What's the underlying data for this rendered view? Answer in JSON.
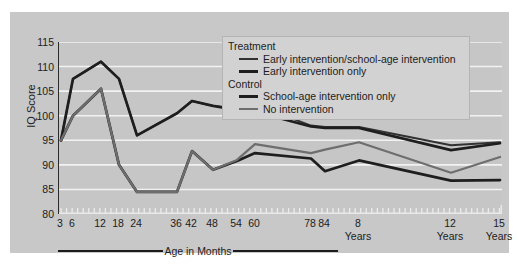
{
  "chart_data": {
    "type": "line",
    "title": "",
    "xlabel": "Age in Months",
    "ylabel": "IQ Score",
    "ylim": [
      80,
      115
    ],
    "yticks": [
      115,
      110,
      105,
      100,
      95,
      90,
      85,
      80
    ],
    "grid": true,
    "legend_position": "top-right",
    "x_axis_sections": [
      {
        "label": "Age in Months",
        "ticks": [
          "3",
          "6",
          "12",
          "18",
          "24",
          "36",
          "42",
          "48",
          "54",
          "60",
          "78",
          "84"
        ]
      },
      {
        "label": "Years",
        "ticks": [
          "8",
          "12",
          "15"
        ]
      }
    ],
    "x": [
      3,
      6,
      12,
      18,
      24,
      36,
      42,
      48,
      54,
      60,
      78,
      84,
      96,
      144,
      180
    ],
    "x_tick_labels": [
      "3",
      "6",
      "12",
      "18",
      "24",
      "36",
      "42",
      "48",
      "54",
      "60",
      "78",
      "84",
      "8",
      "12",
      "15"
    ],
    "x_tick_sublabels": [
      "",
      "",
      "",
      "",
      "",
      "",
      "",
      "",
      "",
      "",
      "",
      "",
      "Years",
      "Years",
      "Years"
    ],
    "series": [
      {
        "name": "Early intervention/school-age intervention",
        "group": "Treatment",
        "color": "#323232",
        "values": [
          95.0,
          107.5,
          111.0,
          107.5,
          96.0,
          100.5,
          103.0,
          102.0,
          101.5,
          102.3,
          98.0,
          97.7,
          97.7,
          94.0,
          94.6
        ]
      },
      {
        "name": "Early intervention only",
        "group": "Treatment",
        "color": "#1e1e1e",
        "values": [
          95.0,
          107.5,
          111.0,
          107.5,
          96.0,
          100.5,
          103.0,
          102.0,
          101.2,
          100.8,
          97.8,
          97.5,
          97.5,
          93.0,
          94.4
        ]
      },
      {
        "name": "School-age intervention only",
        "group": "Control",
        "color": "#1e1e1e",
        "values": [
          95.0,
          100.0,
          105.5,
          90.0,
          84.5,
          84.5,
          92.8,
          89.0,
          90.8,
          92.4,
          91.3,
          88.7,
          90.9,
          86.8,
          86.9
        ]
      },
      {
        "name": "No intervention",
        "group": "Control",
        "color": "#6e6e6e",
        "values": [
          95.0,
          100.0,
          105.5,
          90.0,
          84.5,
          84.5,
          92.8,
          89.0,
          91.0,
          94.2,
          92.4,
          93.1,
          94.6,
          88.4,
          91.6
        ]
      }
    ]
  },
  "legend": {
    "groups": [
      {
        "title": "Treatment",
        "entries": [
          {
            "label": "Early intervention/school-age intervention",
            "color": "#323232",
            "thickness": 2
          },
          {
            "label": "Early intervention only",
            "color": "#1e1e1e",
            "thickness": 3
          }
        ]
      },
      {
        "title": "Control",
        "entries": [
          {
            "label": "School-age intervention only",
            "color": "#1e1e1e",
            "thickness": 3
          },
          {
            "label": "No intervention",
            "color": "#6e6e6e",
            "thickness": 2.5
          }
        ]
      }
    ]
  },
  "colors": {
    "figure_background": "#ffffff",
    "panel_background": "#c8c8c8",
    "plot_background": "#c6c6c6",
    "gridline": "#f2f2f2",
    "axis": "#2b2b2b",
    "text": "#1c1c1c",
    "legend_background": "#d2d2d2"
  }
}
